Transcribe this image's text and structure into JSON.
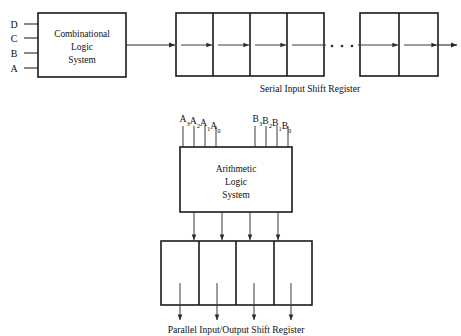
{
  "diagram": {
    "blocks": {
      "combinational": {
        "name": "combinational-logic-system",
        "lines": [
          "Combinational",
          "Logic",
          "System"
        ],
        "x": 38,
        "y": 13,
        "w": 88,
        "h": 64
      },
      "arithmetic": {
        "name": "arithmetic-logic-system",
        "lines": [
          "Arithmetic",
          "Logic",
          "System"
        ],
        "x": 180,
        "y": 147,
        "w": 112,
        "h": 65
      }
    },
    "registers": {
      "serial": {
        "caption": "Serial Input Shift Register",
        "caption_x": 310,
        "caption_y": 89,
        "group_a": {
          "x": 176,
          "y": 13,
          "w": 148,
          "h": 63,
          "cells": 4
        },
        "group_b": {
          "x": 360,
          "y": 13,
          "w": 78,
          "h": 63,
          "cells": 2
        },
        "ellipsis_dots": 3,
        "ellipsis_x": [
          332,
          342,
          352
        ],
        "ellipsis_y": 46
      },
      "parallel": {
        "caption": "Parallel Input/Output Shift Register",
        "caption_x": 236,
        "caption_y": 330,
        "x": 161,
        "y": 241,
        "w": 151,
        "h": 64,
        "cells": 4
      }
    },
    "inputs": {
      "combinational": [
        {
          "label": "D",
          "x": 14,
          "y": 24
        },
        {
          "label": "C",
          "x": 14,
          "y": 38
        },
        {
          "label": "B",
          "x": 14,
          "y": 53
        },
        {
          "label": "A",
          "x": 14,
          "y": 68
        }
      ],
      "alu_bus_a": {
        "name": "operand-a-bus",
        "letter": "A",
        "bits": [
          "3",
          "2",
          "1",
          "0"
        ],
        "label_x": 200,
        "label_y": 121,
        "line_x": [
          183,
          194,
          205,
          216
        ],
        "line_top": 126,
        "line_bottom": 147
      },
      "alu_bus_b": {
        "name": "operand-b-bus",
        "letter": "B",
        "bits": [
          "3",
          "2",
          "1",
          "0"
        ],
        "label_x": 270,
        "label_y": 121,
        "line_x": [
          255,
          266,
          277,
          288
        ],
        "line_top": 126,
        "line_bottom": 147
      }
    },
    "connections": {
      "comb_to_serial": {
        "name": "combinational-to-serial-wire",
        "x1": 126,
        "x2": 176,
        "y": 45
      },
      "serial_output": {
        "name": "serial-register-output-wire",
        "x1": 438,
        "x2": 458,
        "y": 45
      },
      "serial_input": {
        "name": "serial-register-input-arrow",
        "x1": 165,
        "x2": 176,
        "y": 45
      },
      "alu_out_x": [
        194,
        222,
        250,
        278
      ],
      "alu_out_top": 212,
      "alu_out_bottom": 241,
      "par_out_x": [
        180,
        217,
        254,
        291
      ],
      "par_out_top": 305,
      "par_out_bottom": 321,
      "internal_arrow_y": 45
    },
    "colors": {
      "stroke": "#1a1a1a",
      "wire": "#2a2a2a",
      "background": "#ffffff",
      "text": "#111111"
    }
  }
}
